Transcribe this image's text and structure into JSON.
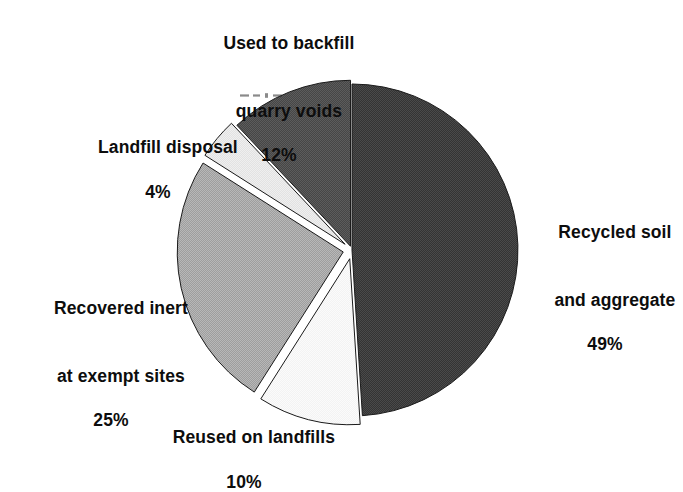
{
  "chart_data": {
    "type": "pie",
    "title": "",
    "subtitle": "",
    "xlabel": "",
    "ylabel": "",
    "legend_position": "none",
    "grid": false,
    "units": "percent",
    "total": 100,
    "start_angle_deg": 0,
    "direction": "clockwise",
    "exploded": true,
    "categories": [
      "Recycled soil and aggregate",
      "Reused on landfills",
      "Recovered inert at exempt sites",
      "Landfill disposal",
      "Used to backfill quarry voids"
    ],
    "values": [
      49,
      10,
      25,
      4,
      12
    ],
    "slices": [
      {
        "name": "recycled-soil-and-aggregate",
        "label_line1": "Recycled soil",
        "label_line2": "and aggregate",
        "percent_text": "49%",
        "value": 49,
        "color": "#3c3c3c",
        "start_deg": 0,
        "end_deg": 176.4,
        "explode": 0
      },
      {
        "name": "reused-on-landfills",
        "label_line1": "Reused on landfills",
        "label_line2": "",
        "percent_text": "10%",
        "value": 10,
        "color": "#f2f2f2",
        "start_deg": 176.4,
        "end_deg": 212.4,
        "explode": 9
      },
      {
        "name": "recovered-inert-at-exempt-sites",
        "label_line1": "Recovered inert",
        "label_line2": "at exempt sites",
        "percent_text": "25%",
        "value": 25,
        "color": "#a9a9a9",
        "start_deg": 212.4,
        "end_deg": 302.4,
        "explode": 9
      },
      {
        "name": "landfill-disposal",
        "label_line1": "Landfill disposal",
        "label_line2": "",
        "percent_text": "4%",
        "value": 4,
        "color": "#e4e4e4",
        "start_deg": 302.4,
        "end_deg": 316.8,
        "explode": 9
      },
      {
        "name": "used-to-backfill-quarry-voids",
        "label_line1": "Used to backfill",
        "label_line2": "quarry voids",
        "percent_text": "12%",
        "value": 12,
        "color": "#4e4e4e",
        "start_deg": 316.8,
        "end_deg": 360,
        "explode": 4
      }
    ],
    "geometry": {
      "center_x": 352,
      "center_y": 250,
      "radius": 166
    },
    "colors": {
      "background": "#ffffff",
      "text": "#0d0d0d",
      "outline": "#1a1a1a",
      "dark_slice": "#3c3c3c",
      "mid_dark_slice": "#4e4e4e",
      "mid_slice": "#a9a9a9",
      "light_slice": "#e4e4e4",
      "lightest_slice": "#f2f2f2"
    }
  },
  "labels": {
    "backfill": {
      "line1": "Used to backfill",
      "line2": "quarry voids",
      "percent": "12%"
    },
    "landfill_disposal": {
      "line1": "Landfill disposal",
      "percent": "4%"
    },
    "recovered_inert": {
      "line1": "Recovered inert",
      "line2": "at exempt sites",
      "percent": "25%"
    },
    "reused": {
      "line1": "Reused on landfills",
      "percent": "10%"
    },
    "recycled_soil": {
      "line1": "Recycled soil",
      "line2": "and aggregate",
      "percent": "49%"
    }
  }
}
